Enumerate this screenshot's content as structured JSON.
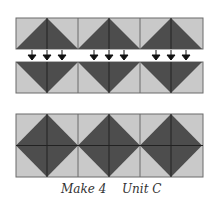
{
  "diagram": {
    "colors": {
      "light": "#c9c9c9",
      "dark": "#4d4d4d",
      "line": "#2a2a2a",
      "border": "#6a6a6a"
    },
    "unit_count": 3,
    "top_strip": {
      "orientation": "triangles-pointing-up"
    },
    "bottom_strip": {
      "orientation": "triangles-pointing-down"
    },
    "arrows": {
      "per_unit": 3,
      "direction": "down"
    },
    "assembled_strip": {
      "orientation": "diamonds"
    }
  },
  "caption": {
    "quantity": "Make 4",
    "unit": "Unit C"
  }
}
